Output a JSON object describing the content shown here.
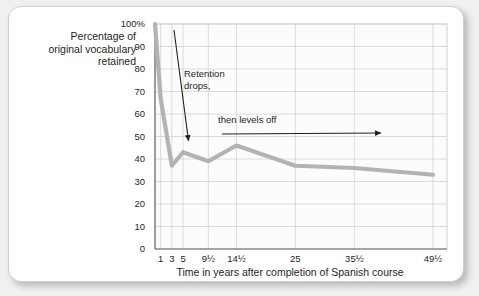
{
  "figure": {
    "y_axis_title_lines": [
      "Percentage of",
      "original vocabulary",
      "retained"
    ],
    "x_axis_title": "Time in years after completion of Spanish course",
    "annotations": [
      {
        "name": "retention-drops",
        "text_line1": "Retention",
        "text_line2": "drops,"
      },
      {
        "name": "then-levels-off",
        "text": "then levels off"
      }
    ],
    "colors": {
      "line": "#b3b3b3",
      "grid": "#c9cfd6",
      "axis": "#6b6b6b",
      "text": "#231f20",
      "card_background": "#ffffff",
      "page_background": "#f0f0f0"
    }
  },
  "chart_data": {
    "type": "line",
    "title": "",
    "xlabel": "Time in years after completion of Spanish course",
    "ylabel": "Percentage of original vocabulary retained",
    "x_tick_labels": [
      "1",
      "3",
      "5",
      "9½",
      "14½",
      "25",
      "35½",
      "49½"
    ],
    "x_tick_values": [
      1,
      3,
      5,
      9.5,
      14.5,
      25,
      35.5,
      49.5
    ],
    "y_tick_labels": [
      "0",
      "10",
      "20",
      "30",
      "40",
      "50",
      "60",
      "70",
      "80",
      "90",
      "100%"
    ],
    "y_tick_values": [
      0,
      10,
      20,
      30,
      40,
      50,
      60,
      70,
      80,
      90,
      100
    ],
    "ylim": [
      0,
      100
    ],
    "xlim": [
      0,
      52
    ],
    "grid": true,
    "legend": "none",
    "series": [
      {
        "name": "Percentage of original vocabulary retained",
        "x": [
          0,
          1,
          3,
          5,
          9.5,
          14.5,
          25,
          35.5,
          49.5
        ],
        "values": [
          100,
          67,
          37,
          43,
          39,
          46,
          37,
          36,
          33
        ]
      }
    ]
  }
}
